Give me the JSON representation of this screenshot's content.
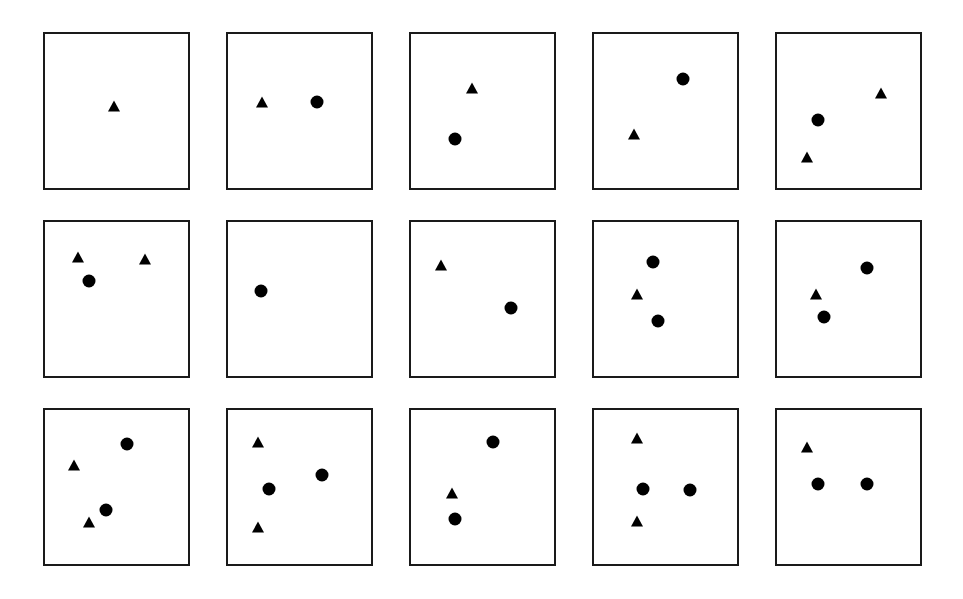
{
  "figure": {
    "title": "",
    "background_color": "#ffffff",
    "marker_color": "#000000",
    "panel_border_color": "#1a1a1a",
    "rows": 3,
    "columns": 5,
    "panel_count": 15
  },
  "chart_data": {
    "type": "scatter",
    "title": "",
    "xlabel": "",
    "ylabel": "",
    "xlim": [
      0,
      100
    ],
    "ylim": [
      0,
      100
    ],
    "grid": false,
    "legend": null,
    "layout": {
      "rows": 3,
      "columns": 5,
      "panel_order": "row-major"
    },
    "marker_styles": {
      "circle": "filled black circle",
      "triangle": "filled black triangle"
    },
    "panels": [
      {
        "index": 1,
        "row": 1,
        "column": 1,
        "n_points": 1,
        "points": [
          {
            "marker": "triangle",
            "x": 48,
            "y": 53
          }
        ]
      },
      {
        "index": 2,
        "row": 1,
        "column": 2,
        "n_points": 2,
        "points": [
          {
            "marker": "triangle",
            "x": 24,
            "y": 56
          },
          {
            "marker": "circle",
            "x": 62,
            "y": 56
          }
        ]
      },
      {
        "index": 3,
        "row": 1,
        "column": 3,
        "n_points": 2,
        "points": [
          {
            "marker": "triangle",
            "x": 43,
            "y": 65
          },
          {
            "marker": "circle",
            "x": 31,
            "y": 32
          }
        ]
      },
      {
        "index": 4,
        "row": 1,
        "column": 4,
        "n_points": 2,
        "points": [
          {
            "marker": "circle",
            "x": 62,
            "y": 71
          },
          {
            "marker": "triangle",
            "x": 28,
            "y": 35
          }
        ]
      },
      {
        "index": 5,
        "row": 1,
        "column": 5,
        "n_points": 3,
        "points": [
          {
            "marker": "triangle",
            "x": 73,
            "y": 62
          },
          {
            "marker": "circle",
            "x": 29,
            "y": 44
          },
          {
            "marker": "triangle",
            "x": 21,
            "y": 20
          }
        ]
      },
      {
        "index": 6,
        "row": 2,
        "column": 1,
        "n_points": 3,
        "points": [
          {
            "marker": "triangle",
            "x": 23,
            "y": 77
          },
          {
            "marker": "triangle",
            "x": 70,
            "y": 76
          },
          {
            "marker": "circle",
            "x": 31,
            "y": 62
          }
        ]
      },
      {
        "index": 7,
        "row": 2,
        "column": 2,
        "n_points": 1,
        "points": [
          {
            "marker": "circle",
            "x": 23,
            "y": 55
          }
        ]
      },
      {
        "index": 8,
        "row": 2,
        "column": 3,
        "n_points": 2,
        "points": [
          {
            "marker": "triangle",
            "x": 21,
            "y": 72
          },
          {
            "marker": "circle",
            "x": 70,
            "y": 44
          }
        ]
      },
      {
        "index": 9,
        "row": 2,
        "column": 4,
        "n_points": 3,
        "points": [
          {
            "marker": "circle",
            "x": 41,
            "y": 74
          },
          {
            "marker": "triangle",
            "x": 30,
            "y": 53
          },
          {
            "marker": "circle",
            "x": 45,
            "y": 36
          }
        ]
      },
      {
        "index": 10,
        "row": 2,
        "column": 5,
        "n_points": 3,
        "points": [
          {
            "marker": "circle",
            "x": 63,
            "y": 70
          },
          {
            "marker": "triangle",
            "x": 27,
            "y": 53
          },
          {
            "marker": "circle",
            "x": 33,
            "y": 38
          }
        ]
      },
      {
        "index": 11,
        "row": 3,
        "column": 1,
        "n_points": 4,
        "points": [
          {
            "marker": "circle",
            "x": 57,
            "y": 78
          },
          {
            "marker": "triangle",
            "x": 20,
            "y": 64
          },
          {
            "marker": "circle",
            "x": 43,
            "y": 35
          },
          {
            "marker": "triangle",
            "x": 31,
            "y": 27
          }
        ]
      },
      {
        "index": 12,
        "row": 3,
        "column": 2,
        "n_points": 4,
        "points": [
          {
            "marker": "triangle",
            "x": 21,
            "y": 79
          },
          {
            "marker": "circle",
            "x": 66,
            "y": 58
          },
          {
            "marker": "circle",
            "x": 29,
            "y": 49
          },
          {
            "marker": "triangle",
            "x": 21,
            "y": 24
          }
        ]
      },
      {
        "index": 13,
        "row": 3,
        "column": 3,
        "n_points": 3,
        "points": [
          {
            "marker": "circle",
            "x": 57,
            "y": 79
          },
          {
            "marker": "triangle",
            "x": 29,
            "y": 46
          },
          {
            "marker": "circle",
            "x": 31,
            "y": 29
          }
        ]
      },
      {
        "index": 14,
        "row": 3,
        "column": 4,
        "n_points": 4,
        "points": [
          {
            "marker": "triangle",
            "x": 30,
            "y": 82
          },
          {
            "marker": "circle",
            "x": 34,
            "y": 49
          },
          {
            "marker": "circle",
            "x": 67,
            "y": 48
          },
          {
            "marker": "triangle",
            "x": 30,
            "y": 28
          }
        ]
      },
      {
        "index": 15,
        "row": 3,
        "column": 5,
        "n_points": 3,
        "points": [
          {
            "marker": "triangle",
            "x": 21,
            "y": 76
          },
          {
            "marker": "circle",
            "x": 29,
            "y": 52
          },
          {
            "marker": "circle",
            "x": 63,
            "y": 52
          }
        ]
      }
    ]
  }
}
